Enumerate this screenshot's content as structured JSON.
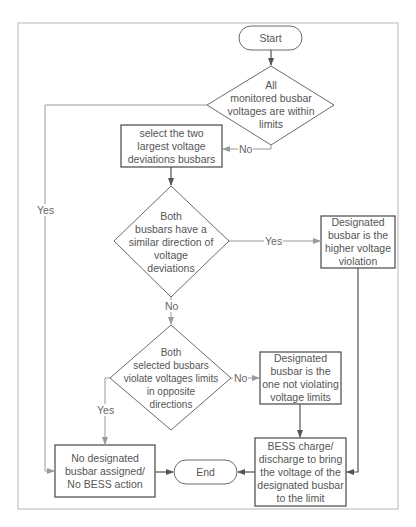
{
  "diagram": {
    "type": "flowchart",
    "colors": {
      "frame": "#b8b8b8",
      "shape_stroke": "#6a6a6a",
      "arrow_dark": "#555555",
      "arrow_light": "#9a9a9a",
      "text": "#555555"
    },
    "nodes": {
      "start": {
        "shape": "terminator",
        "text": "Start"
      },
      "check_limits": {
        "shape": "decision",
        "text": "All\nmonitored busbar\nvoltages are within\nlimits"
      },
      "select_two": {
        "shape": "process",
        "text": "select the two\nlargest voltage\ndeviations busbars"
      },
      "similar_direction": {
        "shape": "decision",
        "text": "Both\nbusbars have a\nsimilar direction of\nvoltage\ndeviations"
      },
      "higher_violation": {
        "shape": "process",
        "text": "Designated\nbusbar is  the\nhigher voltage\nviolation"
      },
      "opposite_directions": {
        "shape": "decision",
        "text": "Both\nselected busbars\nviolate voltages limits\nin opposite\ndirections"
      },
      "not_violating": {
        "shape": "process",
        "text": "Designated\nbusbar is the\none not violating\nvoltage limits"
      },
      "no_action": {
        "shape": "process",
        "text": "No designated\nbusbar assigned/\nNo  BESS action"
      },
      "end": {
        "shape": "terminator",
        "text": "End"
      },
      "bess_action": {
        "shape": "process",
        "text": "BESS charge/\ndischarge to bring\nthe voltage of the\ndesignated busbar\nto the limit"
      }
    },
    "edges": [
      {
        "from": "start",
        "to": "check_limits",
        "label": ""
      },
      {
        "from": "check_limits",
        "to": "select_two",
        "label": "No"
      },
      {
        "from": "check_limits",
        "to": "no_action",
        "label": "Yes"
      },
      {
        "from": "select_two",
        "to": "similar_direction",
        "label": ""
      },
      {
        "from": "similar_direction",
        "to": "higher_violation",
        "label": "Yes"
      },
      {
        "from": "similar_direction",
        "to": "opposite_directions",
        "label": "No"
      },
      {
        "from": "opposite_directions",
        "to": "not_violating",
        "label": "No"
      },
      {
        "from": "opposite_directions",
        "to": "no_action",
        "label": "Yes"
      },
      {
        "from": "not_violating",
        "to": "bess_action",
        "label": ""
      },
      {
        "from": "higher_violation",
        "to": "bess_action",
        "label": ""
      },
      {
        "from": "no_action",
        "to": "end",
        "label": ""
      },
      {
        "from": "bess_action",
        "to": "end",
        "label": ""
      }
    ],
    "edge_labels": {
      "check_no": "No",
      "check_yes": "Yes",
      "similar_yes": "Yes",
      "similar_no": "No",
      "opposite_no": "No",
      "opposite_yes": "Yes"
    }
  }
}
